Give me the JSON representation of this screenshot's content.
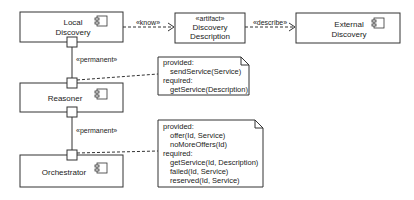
{
  "diagram": {
    "components": {
      "local_discovery": {
        "line1": "Local",
        "line2": "Discovery"
      },
      "discovery_description": {
        "stereotype": "«artifact»",
        "line1": "Discovery",
        "line2": "Description"
      },
      "external_discovery": {
        "line1": "External",
        "line2": "Discovery"
      },
      "reasoner": {
        "name": "Reasoner"
      },
      "orchestrator": {
        "name": "Orchestrator"
      }
    },
    "connectors": {
      "know": "«know»",
      "describe": "«describe»",
      "permanent_top": "«permanent»",
      "permanent_bottom": "«permanent»"
    },
    "notes": {
      "reasoner": {
        "lines": [
          "provided:",
          "sendService(Service)",
          "required:",
          "getService(Description)"
        ]
      },
      "orchestrator": {
        "lines": [
          "provided:",
          "offer(Id, Service)",
          "noMoreOffers(Id)",
          "required:",
          "getService(Id, Description)",
          "failed(Id, Service)",
          "reserved(Id, Service)"
        ]
      }
    }
  }
}
